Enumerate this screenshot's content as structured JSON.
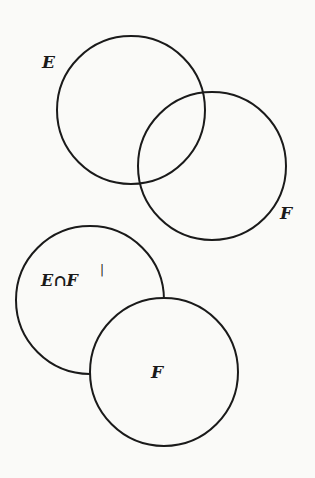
{
  "diagram": {
    "type": "venn",
    "stroke_color": "#1a1a1a",
    "background": "#fafaf8",
    "top": {
      "label_e": "E",
      "label_f": "F",
      "circles": [
        {
          "name": "E",
          "cx": 131,
          "cy": 110,
          "r": 74
        },
        {
          "name": "F",
          "cx": 212,
          "cy": 166,
          "r": 74
        }
      ]
    },
    "bottom": {
      "label_efc": "E∩F",
      "label_prime": "|",
      "label_f": "F",
      "circles": [
        {
          "name": "E∩F'",
          "cx": 90,
          "cy": 300,
          "r": 74
        },
        {
          "name": "F",
          "cx": 164,
          "cy": 372,
          "r": 74
        }
      ]
    }
  }
}
